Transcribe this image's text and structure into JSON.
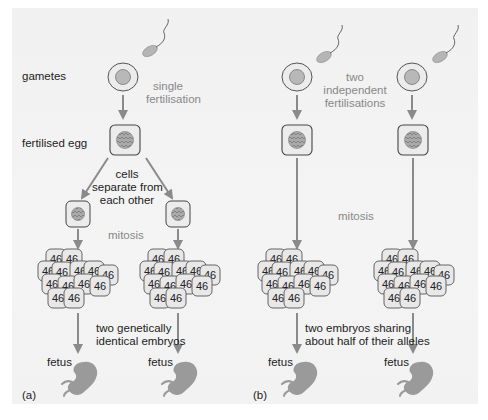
{
  "diagram": {
    "panel_a": {
      "label": "(a)",
      "row_labels": {
        "gametes": "gametes",
        "fertilised_egg": "fertilised egg"
      },
      "fertilisation_note": [
        "single",
        "fertilisation"
      ],
      "separation_note": [
        "cells",
        "separate from",
        "each other"
      ],
      "mitosis_label": "mitosis",
      "embryo_note": [
        "two genetically",
        "identical embryos"
      ],
      "fetus_labels": [
        "fetus",
        "fetus"
      ],
      "cell_chromosome_count": "46"
    },
    "panel_b": {
      "label": "(b)",
      "fertilisation_note": [
        "two",
        "independent",
        "fertilisations"
      ],
      "mitosis_label": "mitosis",
      "embryo_note": [
        "two embryos sharing",
        "about half of their alleles"
      ],
      "fetus_labels": [
        "fetus",
        "fetus"
      ],
      "cell_chromosome_count": "46"
    },
    "colors": {
      "panel_bg": "#f2f2f2",
      "arrow": "#8a8a8a",
      "cell_fill": "#e9e9e9",
      "cell_stroke": "#555555",
      "nucleus_fill": "#b8b8b8",
      "fetus_fill": "#9a9a9a",
      "note_text": "#888888",
      "label_text": "#222222"
    }
  }
}
